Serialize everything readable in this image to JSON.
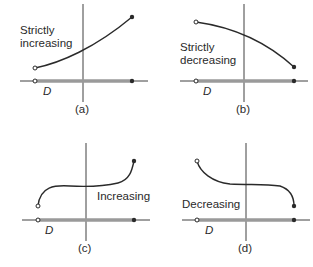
{
  "figure": {
    "panels": [
      {
        "id": "a",
        "caption": "(a)",
        "label_lines": [
          "Strictly",
          "increasing"
        ],
        "domain_label": "D"
      },
      {
        "id": "b",
        "caption": "(b)",
        "label_lines": [
          "Strictly",
          "decreasing"
        ],
        "domain_label": "D"
      },
      {
        "id": "c",
        "caption": "(c)",
        "label_lines": [
          "Increasing"
        ],
        "domain_label": "D"
      },
      {
        "id": "d",
        "caption": "(d)",
        "label_lines": [
          "Decreasing"
        ],
        "domain_label": "D"
      }
    ],
    "colors": {
      "ink": "#2a2a2a",
      "domain_band": "#9a9a9a",
      "background": "#ffffff"
    }
  }
}
